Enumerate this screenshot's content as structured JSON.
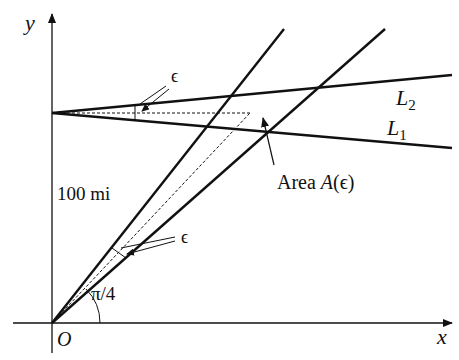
{
  "figure": {
    "axes": {
      "x_label": "x",
      "y_label": "y",
      "origin_label": "O"
    },
    "labels": {
      "distance": "100 mi",
      "angle": "π/4",
      "epsilon_top": "ϵ",
      "epsilon_bottom": "ϵ",
      "line_upper": "L",
      "line_upper_sub": "2",
      "line_lower": "L",
      "line_lower_sub": "1",
      "area_prefix": "Area ",
      "area_func": "A",
      "area_arg": "(ϵ)"
    },
    "colors": {
      "ink": "#111111",
      "background": "#ffffff"
    }
  }
}
